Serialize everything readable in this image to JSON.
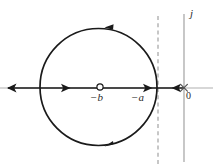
{
  "figure": {
    "type": "root-locus-complex-plane",
    "title": "",
    "background_color": "#ffffff"
  },
  "axes": {
    "real_axis": {
      "name": "real-axis",
      "color": "#b0b0b0",
      "y": 88,
      "x_start": 0,
      "x_end": 213
    },
    "imaginary_axis": {
      "name": "imaginary-axis",
      "label": "j",
      "color": "#9a9a9a",
      "x": 184,
      "y_start": 14,
      "y_end": 162
    },
    "asymptote": {
      "name": "vertical-asymptote",
      "label": "",
      "style": "dashed",
      "color": "#9a9a9a",
      "x": 158,
      "y_start": 16,
      "y_end": 164
    }
  },
  "markers": {
    "pole_origin": {
      "symbol": "x",
      "label": "0",
      "x": 184,
      "y": 88,
      "color": "#555555"
    },
    "zero_b": {
      "symbol": "o",
      "label": "−b",
      "x": 100,
      "y": 87,
      "color": "#2b2b2b"
    },
    "point_a": {
      "symbol": "",
      "label": "−a",
      "x": 147,
      "y": 88,
      "color": "#2b2b2b"
    }
  },
  "locus": {
    "circle": {
      "name": "root-locus-circle",
      "center_x": 98.5,
      "center_y": 87,
      "radius": 58.5,
      "color": "#1a1a1a",
      "stroke_width": 1.7,
      "direction": "clockwise-left",
      "arrow_top_label": "arrow-left",
      "arrow_bottom_label": "arrow-left"
    },
    "real_axis_branch": {
      "name": "real-axis-branch",
      "color": "#1a1a1a",
      "stroke_width": 1.7,
      "segments": [
        {
          "x_start": 10,
          "x_end": 100
        },
        {
          "x_start": 100,
          "x_end": 184
        }
      ],
      "arrows": [
        {
          "x": 10,
          "direction": "left",
          "name": "arrow-far-left"
        },
        {
          "x": 67,
          "direction": "right",
          "name": "arrow-mid-left"
        },
        {
          "x": 150,
          "direction": "right",
          "name": "arrow-toward-asymptote"
        },
        {
          "x": 177,
          "direction": "left",
          "name": "arrow-toward-origin"
        }
      ]
    }
  },
  "colors": {
    "locus": "#1a1a1a",
    "axis_grey": "#9a9a9a",
    "real_axis_grey": "#b0b0b0",
    "label": "#2b2b2b",
    "pole_marker": "#555555"
  }
}
